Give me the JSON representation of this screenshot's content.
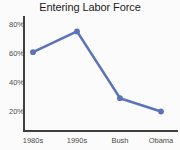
{
  "chart_data": {
    "type": "line",
    "title": "Entering Labor Force",
    "xlabel": "",
    "ylabel": "",
    "categories": [
      "1980s",
      "1990s",
      "Bush",
      "Obama"
    ],
    "values": [
      61,
      75,
      30,
      21
    ],
    "value_suffix": "%",
    "ylim": [
      10,
      85
    ],
    "ytick_values": [
      20,
      40,
      60,
      80
    ],
    "ytick_labels": [
      "20%",
      "40%",
      "60%",
      "80%"
    ],
    "grid": false,
    "legend": "none",
    "series": [
      {
        "name": "Entering Labor Force",
        "values": [
          61,
          75,
          30,
          21
        ],
        "color": "#5b74b8",
        "marker": "circle"
      }
    ]
  },
  "axis": {
    "tick_20": "20%",
    "tick_40": "40%",
    "tick_60": "60%",
    "tick_80": "80%",
    "cat_0": "1980s",
    "cat_1": "1990s",
    "cat_2": "Bush",
    "cat_3": "Obama"
  },
  "colors": {
    "line": "#5b74b8",
    "marker": "#5b74b8",
    "axis": "#3f3f3f",
    "text": "#4a4a4a",
    "title": "#1c1c1c",
    "background": "#fbfbfb"
  }
}
